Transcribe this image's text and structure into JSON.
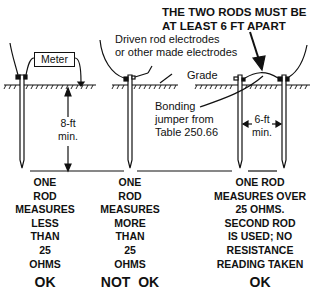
{
  "title": {
    "line1": "THE TWO RODS MUST BE",
    "line2": "AT LEAST 6 FT APART"
  },
  "labels": {
    "meter": "Meter",
    "driven_rod_line1": "Driven rod electrodes",
    "driven_rod_line2": "or other made electrodes",
    "grade": "Grade",
    "bonding_line1": "Bonding",
    "bonding_line2": "jumper from",
    "bonding_line3": "Table 250.66",
    "depth_line1": "8-ft",
    "depth_line2": "min.",
    "spacing_line1": "6-ft",
    "spacing_line2": "min."
  },
  "columns": [
    {
      "lines": [
        "ONE",
        "ROD",
        "MEASURES",
        "LESS",
        "THAN",
        "25",
        "OHMS"
      ],
      "verdict": "OK"
    },
    {
      "lines": [
        "ONE",
        "ROD",
        "MEASURES",
        "MORE",
        "THAN",
        "25",
        "OHMS"
      ],
      "verdict": "NOT  OK"
    },
    {
      "lines": [
        "ONE ROD",
        "MEASURES OVER",
        "25 OHMS.",
        "SECOND ROD",
        "IS USED; NO",
        "RESISTANCE",
        "READING TAKEN"
      ],
      "verdict": "OK"
    }
  ],
  "colors": {
    "ink": "#111111",
    "background": "#ffffff"
  }
}
